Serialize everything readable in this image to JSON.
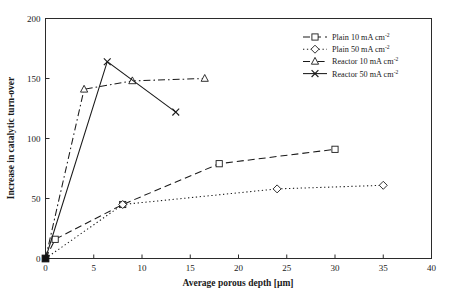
{
  "chart_data": {
    "type": "line",
    "title": "",
    "xlabel": "Average porous depth [µm]",
    "ylabel": "Increase in catalytic turn-over",
    "xlim": [
      0,
      40
    ],
    "ylim": [
      0,
      200
    ],
    "xticks": [
      0,
      5,
      10,
      15,
      20,
      25,
      30,
      35,
      40
    ],
    "xtick_labels": [
      "0",
      "5",
      "10",
      "15",
      "20",
      "25",
      "30",
      "35",
      "40"
    ],
    "yticks": [
      0,
      50,
      100,
      150,
      200
    ],
    "ytick_labels": [
      "0",
      "50",
      "100",
      "150",
      "200"
    ],
    "grid": false,
    "legend_position": "top-right",
    "series": [
      {
        "name": "Plain 10 mA cm",
        "name_sup": "-2",
        "marker": "square",
        "linestyle": "dashed",
        "color": "#1a1a1a",
        "x": [
          0,
          1,
          8,
          18,
          30
        ],
        "y": [
          0,
          16,
          45,
          79,
          91
        ]
      },
      {
        "name": "Plain 50 mA cm",
        "name_sup": "-2",
        "marker": "diamond",
        "linestyle": "dotted",
        "color": "#1a1a1a",
        "x": [
          0,
          8,
          24,
          35
        ],
        "y": [
          0,
          45,
          58,
          61
        ]
      },
      {
        "name": "Reactor 10 mA cm",
        "name_sup": "-2",
        "marker": "triangle",
        "linestyle": "dashdot",
        "color": "#1a1a1a",
        "x": [
          0,
          4,
          9,
          16.5
        ],
        "y": [
          0,
          141,
          148,
          150
        ]
      },
      {
        "name": "Reactor 50 mA cm",
        "name_sup": "-2",
        "marker": "cross",
        "linestyle": "solid",
        "color": "#1a1a1a",
        "x": [
          0,
          6.4,
          13.5
        ],
        "y": [
          0,
          164,
          122
        ]
      }
    ],
    "origin_marker": {
      "label": "origin-filled-square",
      "x": 0,
      "y": 0
    }
  },
  "legend": {
    "entries": [
      {
        "label": "Plain 10 mA cm",
        "sup": "-2",
        "marker": "square",
        "linestyle": "dashed"
      },
      {
        "label": "Plain 50 mA cm",
        "sup": "-2",
        "marker": "diamond",
        "linestyle": "dotted"
      },
      {
        "label": "Reactor 10 mA cm",
        "sup": "-2",
        "marker": "triangle",
        "linestyle": "dashdot"
      },
      {
        "label": "Reactor 50 mA cm",
        "sup": "-2",
        "marker": "cross",
        "linestyle": "solid"
      }
    ]
  }
}
